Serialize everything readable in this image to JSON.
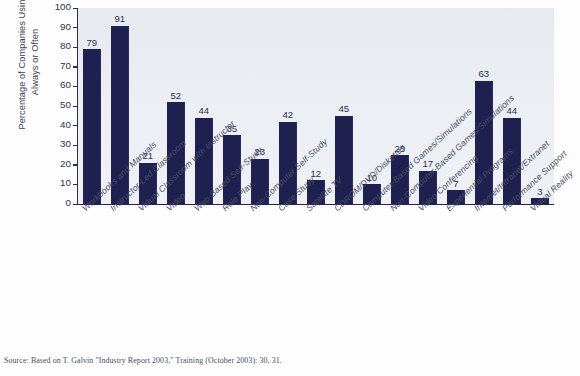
{
  "chart_data": {
    "type": "bar",
    "title": "",
    "xlabel": "",
    "ylabel": "Percentage of Companies Using Always or Often",
    "ylabel_lines": [
      "Percentage of Companies Using",
      "Always or Often"
    ],
    "ylim": [
      0,
      100
    ],
    "ytick_labels": [
      "100",
      "90",
      "80",
      "70",
      "60",
      "50",
      "40",
      "30",
      "20",
      "10",
      "0"
    ],
    "ytick_values": [
      100,
      90,
      80,
      70,
      60,
      50,
      40,
      30,
      20,
      10,
      0
    ],
    "grid": false,
    "legend": null,
    "categories": [
      "Workbooks and Manuals",
      "Instructor-Led Classroom",
      "Virtual Classroom with Instructor",
      "Video",
      "Web-Based Self-Study",
      "Role Play",
      "Non-Computer Self-Study",
      "Case Study",
      "Satellite TV",
      "CDROM/DVD/Diskettes",
      "Computer-Based Games/Simulations",
      "Non-Computer-Based Games/Simulations",
      "Video Conferencing",
      "Experiential Programs",
      "Internet/Intranet/Extranet",
      "Performance Support",
      "Virtual Reality"
    ],
    "values": [
      79,
      91,
      21,
      52,
      44,
      35,
      23,
      42,
      12,
      45,
      10,
      25,
      17,
      7,
      63,
      44,
      3
    ],
    "value_labels": [
      "79",
      "91",
      "21",
      "52",
      "44",
      "35",
      "23",
      "42",
      "12",
      "45",
      "10",
      "25",
      "17",
      "7",
      "63",
      "44",
      "3"
    ],
    "bar_color": "#1f2050",
    "plot_background": "#eceff3"
  },
  "source": {
    "text": "Source: Based on T. Galvin \"Industry Report 2003,\" Training (October 2003): 30, 31."
  }
}
